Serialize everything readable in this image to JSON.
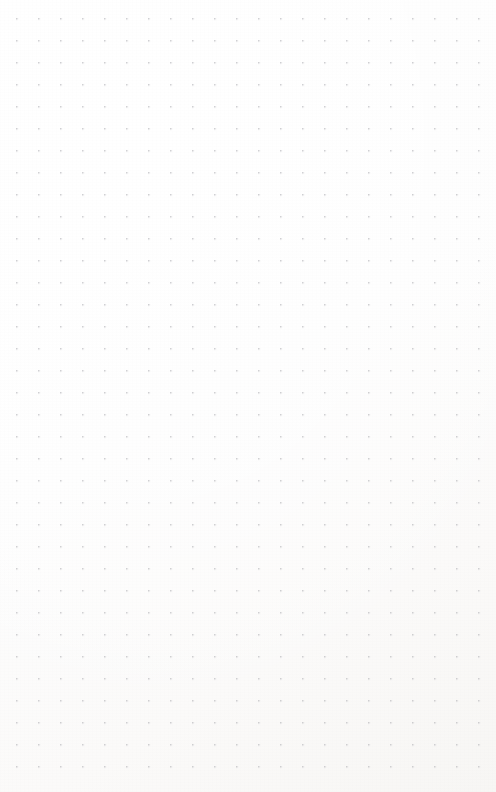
{
  "page": {
    "kind": "dot-grid-page",
    "width": 496,
    "height": 792,
    "background_color": "#fdfdfd",
    "has_text": false,
    "has_ui_controls": false,
    "content_note": ""
  },
  "grid": {
    "dot_color": "#b9b9bd",
    "dot_diameter": 1.6,
    "pitch_x": 22,
    "pitch_y": 22,
    "origin_x": 17,
    "origin_y": 19,
    "columns": 22,
    "rows": 35,
    "margin_left": 17,
    "margin_top": 19,
    "margin_right": 17,
    "margin_bottom": 25
  }
}
